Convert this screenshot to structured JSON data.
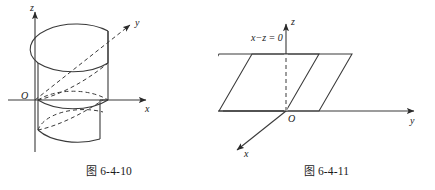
{
  "page": {
    "background_color": "#ffffff",
    "line_color": "#3a3a3a",
    "text_color": "#1a1a1a",
    "width": 435,
    "height": 190
  },
  "figures": [
    {
      "id": "figure-6-4-10",
      "caption_cjk": "图",
      "caption_number": "6-4-10",
      "description": "cylinder-surface-3d-axes",
      "axes": [
        {
          "name": "z-axis",
          "label": "z",
          "direction": "up"
        },
        {
          "name": "x-axis",
          "label": "x",
          "direction": "right"
        },
        {
          "name": "y-axis",
          "label": "y",
          "direction": "up-right-dashed"
        }
      ],
      "origin_label": "O"
    },
    {
      "id": "figure-6-4-11",
      "caption_cjk": "图",
      "caption_number": "6-4-11",
      "description": "plane-x-minus-z-equals-zero",
      "axes": [
        {
          "name": "z-axis",
          "label": "z",
          "direction": "up"
        },
        {
          "name": "y-axis",
          "label": "y",
          "direction": "right"
        },
        {
          "name": "x-axis",
          "label": "x",
          "direction": "down-left"
        }
      ],
      "origin_label": "O",
      "plane_equation": "x−z = 0"
    }
  ]
}
